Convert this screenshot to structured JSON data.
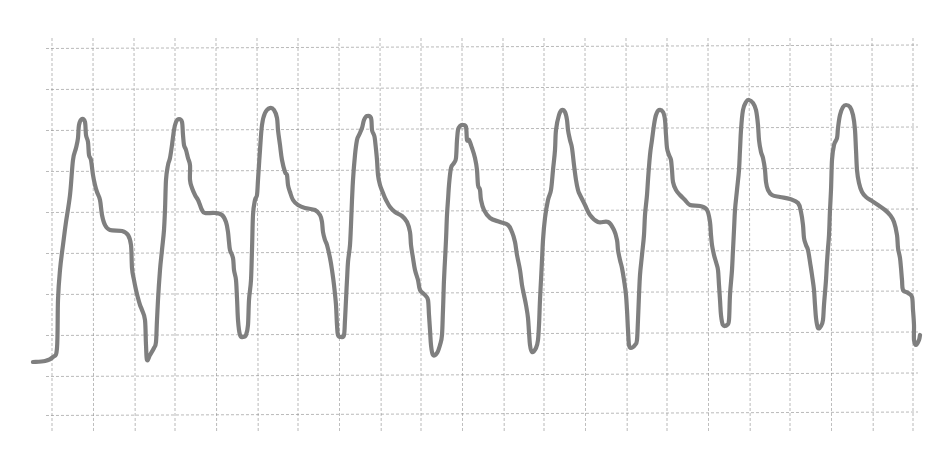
{
  "chart_data": {
    "type": "line",
    "title": "",
    "xlabel": "",
    "ylabel": "",
    "grid": true,
    "legend": null,
    "description": "Periodic waveform (pressure/pulse-like trace) on dashed square grid paper, 9 cycles, no axis labels",
    "style": {
      "trace_color": "#7f7f7f",
      "grid_color": "#8a8a8a",
      "background": "#ffffff"
    },
    "grid_px": {
      "x_lines": [
        52,
        93,
        134,
        175,
        216,
        257,
        298,
        339,
        380,
        421,
        462,
        503,
        544,
        585,
        626,
        667,
        708,
        749,
        790,
        831,
        872,
        913
      ],
      "y_lines": [
        47,
        88,
        129,
        170,
        211,
        252,
        293,
        334,
        375,
        414
      ],
      "x_extent": [
        46,
        918
      ],
      "y_extent": [
        38,
        432
      ]
    },
    "cycles": [
      {
        "index": 1,
        "peak": [
          81,
          120
        ],
        "shoulder": [
          112,
          231
        ],
        "trough": [
          147,
          360
        ]
      },
      {
        "index": 2,
        "peak": [
          178,
          120
        ],
        "shoulder": [
          205,
          213
        ],
        "trough": [
          241,
          337
        ]
      },
      {
        "index": 3,
        "peak": [
          270,
          108
        ],
        "shoulder": [
          300,
          210
        ],
        "trough": [
          341,
          337
        ]
      },
      {
        "index": 4,
        "peak": [
          368,
          116
        ],
        "shoulder": [
          396,
          214
        ],
        "trough": [
          434,
          355
        ]
      },
      {
        "index": 5,
        "peak": [
          462,
          125
        ],
        "shoulder": [
          495,
          222
        ],
        "trough": [
          532,
          352
        ]
      },
      {
        "index": 6,
        "peak": [
          562,
          110
        ],
        "shoulder": [
          600,
          222
        ],
        "trough": [
          630,
          348
        ]
      },
      {
        "index": 7,
        "peak": [
          658,
          110
        ],
        "shoulder": [
          690,
          205
        ],
        "trough": [
          725,
          326
        ]
      },
      {
        "index": 8,
        "peak": [
          748,
          100
        ],
        "shoulder": [
          790,
          198
        ],
        "trough": [
          819,
          328
        ]
      },
      {
        "index": 9,
        "peak": [
          846,
          105
        ],
        "shoulder": [
          875,
          203
        ],
        "trough": [
          917,
          345
        ]
      }
    ],
    "trace_points": [
      [
        33,
        362
      ],
      [
        45,
        361
      ],
      [
        53,
        357
      ],
      [
        57,
        348
      ],
      [
        58,
        300
      ],
      [
        60,
        270
      ],
      [
        63,
        245
      ],
      [
        66,
        222
      ],
      [
        70,
        195
      ],
      [
        73,
        160
      ],
      [
        76,
        148
      ],
      [
        78,
        138
      ],
      [
        79,
        125
      ],
      [
        82,
        119
      ],
      [
        85,
        122
      ],
      [
        86,
        135
      ],
      [
        88,
        142
      ],
      [
        89,
        155
      ],
      [
        91,
        160
      ],
      [
        93,
        175
      ],
      [
        95,
        185
      ],
      [
        97,
        192
      ],
      [
        100,
        200
      ],
      [
        102,
        215
      ],
      [
        105,
        225
      ],
      [
        110,
        230
      ],
      [
        122,
        231
      ],
      [
        128,
        235
      ],
      [
        131,
        245
      ],
      [
        132,
        268
      ],
      [
        134,
        280
      ],
      [
        136,
        290
      ],
      [
        138,
        298
      ],
      [
        140,
        305
      ],
      [
        142,
        310
      ],
      [
        145,
        320
      ],
      [
        146,
        345
      ],
      [
        147,
        360
      ],
      [
        150,
        355
      ],
      [
        154,
        348
      ],
      [
        156,
        342
      ],
      [
        157,
        320
      ],
      [
        158,
        300
      ],
      [
        160,
        270
      ],
      [
        162,
        250
      ],
      [
        164,
        230
      ],
      [
        165,
        210
      ],
      [
        166,
        180
      ],
      [
        168,
        165
      ],
      [
        170,
        158
      ],
      [
        172,
        145
      ],
      [
        174,
        130
      ],
      [
        176,
        122
      ],
      [
        179,
        119
      ],
      [
        182,
        122
      ],
      [
        183,
        135
      ],
      [
        184,
        145
      ],
      [
        186,
        150
      ],
      [
        188,
        158
      ],
      [
        190,
        165
      ],
      [
        190,
        180
      ],
      [
        192,
        188
      ],
      [
        195,
        195
      ],
      [
        198,
        200
      ],
      [
        200,
        205
      ],
      [
        202,
        210
      ],
      [
        205,
        213
      ],
      [
        215,
        213
      ],
      [
        222,
        215
      ],
      [
        226,
        222
      ],
      [
        228,
        232
      ],
      [
        229,
        242
      ],
      [
        230,
        250
      ],
      [
        233,
        258
      ],
      [
        234,
        270
      ],
      [
        236,
        280
      ],
      [
        237,
        298
      ],
      [
        238,
        320
      ],
      [
        240,
        335
      ],
      [
        243,
        337
      ],
      [
        246,
        335
      ],
      [
        248,
        325
      ],
      [
        249,
        300
      ],
      [
        251,
        280
      ],
      [
        252,
        250
      ],
      [
        253,
        215
      ],
      [
        255,
        200
      ],
      [
        257,
        195
      ],
      [
        258,
        180
      ],
      [
        260,
        150
      ],
      [
        262,
        125
      ],
      [
        265,
        113
      ],
      [
        270,
        108
      ],
      [
        274,
        110
      ],
      [
        277,
        118
      ],
      [
        278,
        130
      ],
      [
        280,
        145
      ],
      [
        282,
        160
      ],
      [
        285,
        172
      ],
      [
        287,
        175
      ],
      [
        288,
        185
      ],
      [
        290,
        192
      ],
      [
        293,
        200
      ],
      [
        298,
        205
      ],
      [
        305,
        208
      ],
      [
        315,
        210
      ],
      [
        320,
        215
      ],
      [
        322,
        222
      ],
      [
        323,
        232
      ],
      [
        325,
        240
      ],
      [
        327,
        245
      ],
      [
        330,
        258
      ],
      [
        332,
        270
      ],
      [
        334,
        285
      ],
      [
        336,
        305
      ],
      [
        337,
        325
      ],
      [
        338,
        335
      ],
      [
        341,
        337
      ],
      [
        344,
        335
      ],
      [
        345,
        320
      ],
      [
        346,
        300
      ],
      [
        347,
        280
      ],
      [
        348,
        262
      ],
      [
        350,
        245
      ],
      [
        351,
        225
      ],
      [
        352,
        200
      ],
      [
        353,
        180
      ],
      [
        355,
        155
      ],
      [
        357,
        140
      ],
      [
        359,
        135
      ],
      [
        362,
        128
      ],
      [
        364,
        120
      ],
      [
        367,
        116
      ],
      [
        371,
        118
      ],
      [
        372,
        130
      ],
      [
        374,
        135
      ],
      [
        375,
        140
      ],
      [
        377,
        160
      ],
      [
        378,
        175
      ],
      [
        380,
        185
      ],
      [
        383,
        193
      ],
      [
        386,
        200
      ],
      [
        390,
        207
      ],
      [
        395,
        212
      ],
      [
        402,
        216
      ],
      [
        407,
        222
      ],
      [
        410,
        232
      ],
      [
        411,
        245
      ],
      [
        413,
        258
      ],
      [
        415,
        270
      ],
      [
        418,
        280
      ],
      [
        420,
        290
      ],
      [
        425,
        295
      ],
      [
        428,
        300
      ],
      [
        429,
        315
      ],
      [
        430,
        330
      ],
      [
        431,
        345
      ],
      [
        433,
        355
      ],
      [
        437,
        353
      ],
      [
        440,
        345
      ],
      [
        442,
        335
      ],
      [
        443,
        310
      ],
      [
        444,
        280
      ],
      [
        445,
        260
      ],
      [
        446,
        240
      ],
      [
        447,
        215
      ],
      [
        448,
        200
      ],
      [
        449,
        185
      ],
      [
        451,
        168
      ],
      [
        454,
        163
      ],
      [
        456,
        158
      ],
      [
        457,
        140
      ],
      [
        458,
        130
      ],
      [
        460,
        126
      ],
      [
        463,
        125
      ],
      [
        466,
        127
      ],
      [
        467,
        140
      ],
      [
        469,
        140
      ],
      [
        472,
        148
      ],
      [
        475,
        158
      ],
      [
        477,
        170
      ],
      [
        478,
        185
      ],
      [
        480,
        190
      ],
      [
        481,
        200
      ],
      [
        484,
        210
      ],
      [
        490,
        218
      ],
      [
        500,
        222
      ],
      [
        508,
        225
      ],
      [
        512,
        232
      ],
      [
        515,
        242
      ],
      [
        517,
        255
      ],
      [
        520,
        270
      ],
      [
        522,
        285
      ],
      [
        524,
        295
      ],
      [
        526,
        305
      ],
      [
        528,
        318
      ],
      [
        529,
        332
      ],
      [
        530,
        345
      ],
      [
        532,
        352
      ],
      [
        536,
        348
      ],
      [
        538,
        340
      ],
      [
        539,
        325
      ],
      [
        540,
        300
      ],
      [
        541,
        280
      ],
      [
        542,
        260
      ],
      [
        543,
        240
      ],
      [
        545,
        218
      ],
      [
        548,
        200
      ],
      [
        551,
        190
      ],
      [
        553,
        170
      ],
      [
        555,
        150
      ],
      [
        556,
        130
      ],
      [
        559,
        115
      ],
      [
        562,
        110
      ],
      [
        565,
        112
      ],
      [
        567,
        120
      ],
      [
        568,
        130
      ],
      [
        570,
        140
      ],
      [
        572,
        148
      ],
      [
        574,
        165
      ],
      [
        576,
        180
      ],
      [
        578,
        190
      ],
      [
        580,
        195
      ],
      [
        585,
        205
      ],
      [
        590,
        215
      ],
      [
        598,
        222
      ],
      [
        608,
        222
      ],
      [
        614,
        230
      ],
      [
        617,
        240
      ],
      [
        618,
        250
      ],
      [
        620,
        260
      ],
      [
        622,
        268
      ],
      [
        624,
        280
      ],
      [
        626,
        295
      ],
      [
        627,
        310
      ],
      [
        628,
        330
      ],
      [
        629,
        345
      ],
      [
        631,
        348
      ],
      [
        635,
        345
      ],
      [
        637,
        340
      ],
      [
        638,
        320
      ],
      [
        639,
        295
      ],
      [
        640,
        275
      ],
      [
        642,
        255
      ],
      [
        644,
        235
      ],
      [
        645,
        215
      ],
      [
        647,
        195
      ],
      [
        648,
        180
      ],
      [
        650,
        155
      ],
      [
        652,
        140
      ],
      [
        654,
        125
      ],
      [
        656,
        115
      ],
      [
        659,
        110
      ],
      [
        663,
        112
      ],
      [
        665,
        120
      ],
      [
        666,
        135
      ],
      [
        667,
        148
      ],
      [
        669,
        155
      ],
      [
        671,
        160
      ],
      [
        672,
        170
      ],
      [
        673,
        182
      ],
      [
        676,
        190
      ],
      [
        680,
        195
      ],
      [
        685,
        200
      ],
      [
        690,
        205
      ],
      [
        700,
        206
      ],
      [
        707,
        210
      ],
      [
        710,
        222
      ],
      [
        711,
        235
      ],
      [
        712,
        245
      ],
      [
        714,
        255
      ],
      [
        716,
        262
      ],
      [
        718,
        270
      ],
      [
        719,
        285
      ],
      [
        720,
        300
      ],
      [
        721,
        315
      ],
      [
        723,
        325
      ],
      [
        727,
        325
      ],
      [
        729,
        320
      ],
      [
        730,
        295
      ],
      [
        732,
        270
      ],
      [
        733,
        250
      ],
      [
        734,
        230
      ],
      [
        735,
        210
      ],
      [
        737,
        190
      ],
      [
        739,
        170
      ],
      [
        740,
        150
      ],
      [
        741,
        130
      ],
      [
        743,
        110
      ],
      [
        746,
        102
      ],
      [
        749,
        100
      ],
      [
        753,
        103
      ],
      [
        756,
        110
      ],
      [
        758,
        125
      ],
      [
        759,
        140
      ],
      [
        761,
        152
      ],
      [
        763,
        158
      ],
      [
        765,
        170
      ],
      [
        766,
        182
      ],
      [
        768,
        190
      ],
      [
        772,
        195
      ],
      [
        780,
        197
      ],
      [
        790,
        199
      ],
      [
        798,
        203
      ],
      [
        801,
        212
      ],
      [
        803,
        225
      ],
      [
        804,
        238
      ],
      [
        806,
        245
      ],
      [
        808,
        250
      ],
      [
        810,
        262
      ],
      [
        812,
        275
      ],
      [
        814,
        290
      ],
      [
        815,
        305
      ],
      [
        816,
        318
      ],
      [
        818,
        328
      ],
      [
        821,
        326
      ],
      [
        823,
        320
      ],
      [
        824,
        305
      ],
      [
        826,
        280
      ],
      [
        827,
        262
      ],
      [
        828,
        248
      ],
      [
        829,
        235
      ],
      [
        830,
        210
      ],
      [
        831,
        190
      ],
      [
        832,
        160
      ],
      [
        834,
        145
      ],
      [
        837,
        138
      ],
      [
        838,
        128
      ],
      [
        840,
        115
      ],
      [
        843,
        107
      ],
      [
        846,
        105
      ],
      [
        850,
        107
      ],
      [
        853,
        115
      ],
      [
        855,
        130
      ],
      [
        856,
        150
      ],
      [
        857,
        170
      ],
      [
        859,
        183
      ],
      [
        862,
        192
      ],
      [
        866,
        197
      ],
      [
        872,
        201
      ],
      [
        878,
        205
      ],
      [
        885,
        210
      ],
      [
        890,
        215
      ],
      [
        894,
        222
      ],
      [
        897,
        235
      ],
      [
        898,
        248
      ],
      [
        900,
        258
      ],
      [
        901,
        268
      ],
      [
        902,
        280
      ],
      [
        903,
        290
      ],
      [
        908,
        293
      ],
      [
        912,
        297
      ],
      [
        913,
        310
      ],
      [
        914,
        325
      ],
      [
        914,
        340
      ],
      [
        916,
        345
      ],
      [
        919,
        340
      ],
      [
        920,
        335
      ]
    ]
  }
}
